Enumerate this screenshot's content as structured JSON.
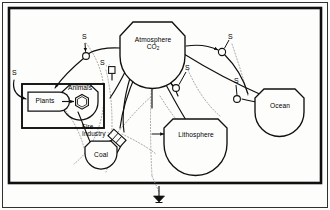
{
  "diagram": {
    "style": "odum-energy-systems",
    "ink_color": "#101010",
    "background_color": "#fdfdfc",
    "dotted_color": "#9a9a9a",
    "frame": {
      "outer_border": "thin",
      "system_boundary": "thick rectangle"
    },
    "nodes": [
      {
        "id": "atmosphere",
        "label_line1": "Atmosphere",
        "label_line2": "CO",
        "label_sub": "2",
        "shape": "storage-tank",
        "x": 152,
        "y": 46
      },
      {
        "id": "plants",
        "label": "Plants",
        "shape": "producer-bullet",
        "x": 51,
        "y": 101
      },
      {
        "id": "animals",
        "label": "Animals",
        "shape": "consumer-hexagon-in-tank",
        "x": 93,
        "y": 100
      },
      {
        "id": "coal",
        "label": "Coal",
        "shape": "storage-tank",
        "x": 101,
        "y": 155
      },
      {
        "id": "lithosphere",
        "label": "Lithosphere",
        "shape": "storage-tank",
        "x": 195,
        "y": 136
      },
      {
        "id": "ocean",
        "label": "Ocean",
        "shape": "storage-tank",
        "x": 279,
        "y": 107
      }
    ],
    "interaction": {
      "id": "fire-industry",
      "label_line1": "Fire",
      "label_line2": "Industry",
      "symbol": "interaction-box",
      "x": 117,
      "y": 131
    },
    "source_labels": [
      {
        "id": "s-sunlight",
        "text": "S",
        "x": 12,
        "y": 73
      },
      {
        "id": "s-plant-flow",
        "text": "S",
        "x": 83,
        "y": 32
      },
      {
        "id": "s-mid-left",
        "text": "S",
        "x": 103,
        "y": 63
      },
      {
        "id": "s-mid-right",
        "text": "S",
        "x": 186,
        "y": 64
      },
      {
        "id": "s-upper-right",
        "text": "S",
        "x": 228,
        "y": 32
      },
      {
        "id": "s-ocean",
        "text": "S",
        "x": 235,
        "y": 77
      }
    ],
    "heat_sink": {
      "id": "heat-sink-ground",
      "x": 159,
      "y": 199
    }
  }
}
